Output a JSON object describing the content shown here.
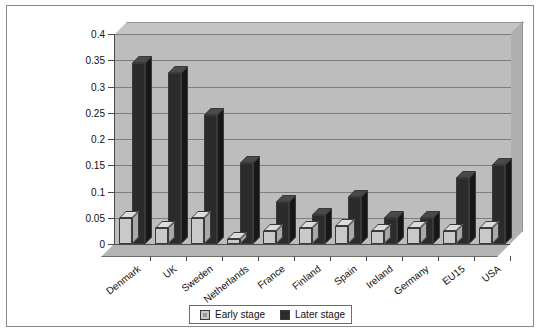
{
  "chart_data": {
    "type": "bar",
    "title": "",
    "subtitle": "",
    "xlabel": "",
    "ylabel": "",
    "ylim": [
      0,
      0.4
    ],
    "grid": true,
    "legend_position": "bottom",
    "y_ticks": [
      "0",
      "0.05",
      "0.1",
      "0.15",
      "0.2",
      "0.25",
      "0.3",
      "0.35",
      "0.4"
    ],
    "y_tick_values": [
      0,
      0.05,
      0.1,
      0.15,
      0.2,
      0.25,
      0.3,
      0.35,
      0.4
    ],
    "categories": [
      "Denmark",
      "UK",
      "Sweden",
      "Netherlands",
      "France",
      "Finland",
      "Spain",
      "Ireland",
      "Germany",
      "EU15",
      "USA"
    ],
    "series": [
      {
        "name": "Early stage",
        "color": "#c9c9c9",
        "values": [
          0.05,
          0.03,
          0.05,
          0.01,
          0.025,
          0.03,
          0.035,
          0.025,
          0.03,
          0.025,
          0.03
        ]
      },
      {
        "name": "Later stage",
        "color": "#2b2b2b",
        "values": [
          0.345,
          0.325,
          0.245,
          0.155,
          0.08,
          0.055,
          0.09,
          0.05,
          0.05,
          0.125,
          0.15
        ]
      }
    ]
  },
  "legend": {
    "entries": [
      {
        "label": "Early stage",
        "swatch": "early"
      },
      {
        "label": "Later stage",
        "swatch": "later"
      }
    ]
  }
}
